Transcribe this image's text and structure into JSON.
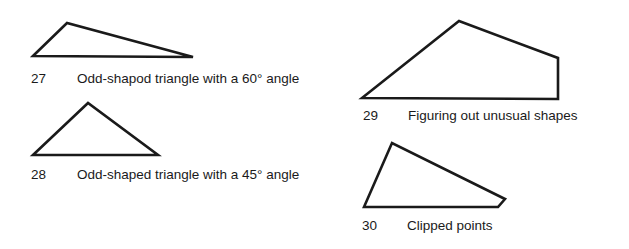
{
  "figures": [
    {
      "number": "27",
      "caption": "Odd-shapod triangle with a 60° angle",
      "points": "33,56 67,23 193,57"
    },
    {
      "number": "28",
      "caption": "Odd-shaped triangle with a 45° angle",
      "points": "33,155 88,103 158,155"
    },
    {
      "number": "29",
      "caption": "Figuring out unusual shapes",
      "points": "362,98 459,21 558,58 558,99"
    },
    {
      "number": "30",
      "caption": "Clipped points",
      "points": "364,207 392,143 505,199 498,207"
    }
  ],
  "style": {
    "stroke": "#1a1a1a",
    "stroke_width": 2.6
  }
}
